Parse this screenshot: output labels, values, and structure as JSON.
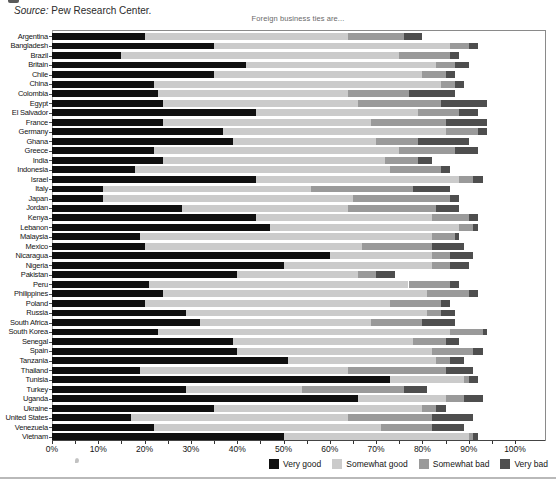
{
  "source_note": {
    "prefix": "Source:",
    "text": " Pew Research Center."
  },
  "chart_data": {
    "type": "bar",
    "stacked": true,
    "orientation": "horizontal",
    "title": "Foreign business ties are...",
    "unit": "percent",
    "xlim": [
      0,
      106
    ],
    "grid": false,
    "legend_position": "bottom",
    "x_tick_labels": [
      "0%",
      "10%",
      "20%",
      "30%",
      "40%",
      "50%",
      "60%",
      "70%",
      "80%",
      "90%",
      "100%"
    ],
    "categories": [
      "Argentina",
      "Bangladesh",
      "Brazil",
      "Britain",
      "Chile",
      "China",
      "Colombia",
      "Egypt",
      "El Salvador",
      "France",
      "Germany",
      "Ghana",
      "Greece",
      "India",
      "Indonesia",
      "Israel",
      "Italy",
      "Japan",
      "Jordan",
      "Kenya",
      "Lebanon",
      "Malaysia",
      "Mexico",
      "Nicaragua",
      "Nigeria",
      "Pakistan",
      "Peru",
      "Philippines",
      "Poland",
      "Russia",
      "South Africa",
      "South Korea",
      "Senegal",
      "Spain",
      "Tanzania",
      "Thailand",
      "Tunisia",
      "Turkey",
      "Uganda",
      "Ukraine",
      "United States",
      "Venezuela",
      "Vietnam"
    ],
    "series": [
      {
        "name": "Very good",
        "color": "#101010",
        "values": [
          20,
          35,
          15,
          42,
          35,
          22,
          23,
          24,
          44,
          24,
          37,
          39,
          22,
          24,
          18,
          44,
          11,
          11,
          28,
          44,
          47,
          19,
          20,
          60,
          50,
          40,
          21,
          24,
          20,
          29,
          32,
          23,
          39,
          40,
          51,
          19,
          73,
          29,
          66,
          35,
          17,
          22,
          50
        ]
      },
      {
        "name": "Somewhat good",
        "color": "#cbcbcb",
        "values": [
          44,
          51,
          60,
          41,
          45,
          62,
          41,
          42,
          35,
          45,
          48,
          31,
          53,
          48,
          55,
          44,
          45,
          54,
          36,
          38,
          41,
          63,
          47,
          22,
          32,
          26,
          56,
          57,
          53,
          52,
          37,
          63,
          39,
          42,
          32,
          45,
          16,
          25,
          19,
          45,
          47,
          49,
          40
        ]
      },
      {
        "name": "Somewhat bad",
        "color": "#9a9a9a",
        "values": [
          12,
          4,
          11,
          4,
          5,
          3,
          13,
          18,
          9,
          16,
          7,
          9,
          12,
          7,
          11,
          3,
          22,
          21,
          19,
          8,
          3,
          5,
          15,
          4,
          4,
          4,
          9,
          9,
          11,
          3,
          11,
          7,
          7,
          9,
          3,
          21,
          1,
          22,
          4,
          3,
          18,
          11,
          1
        ]
      },
      {
        "name": "Very bad",
        "color": "#4e4e4e",
        "values": [
          4,
          2,
          2,
          3,
          2,
          2,
          10,
          10,
          4,
          9,
          2,
          11,
          5,
          3,
          2,
          2,
          8,
          2,
          5,
          2,
          1,
          1,
          7,
          5,
          4,
          4,
          2,
          2,
          2,
          3,
          7,
          1,
          3,
          2,
          3,
          6,
          2,
          5,
          4,
          2,
          9,
          7,
          1
        ]
      }
    ]
  }
}
